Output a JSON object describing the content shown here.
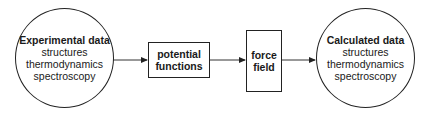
{
  "diagram": {
    "nodes": [
      {
        "id": "experimental",
        "shape": "circle",
        "title": "Experimental data",
        "lines": [
          "structures",
          "thermodynamics",
          "spectroscopy"
        ]
      },
      {
        "id": "potential",
        "shape": "box",
        "lines": [
          "potential",
          "functions"
        ]
      },
      {
        "id": "forcefield",
        "shape": "box",
        "lines": [
          "force",
          "field"
        ]
      },
      {
        "id": "calculated",
        "shape": "circle",
        "title": "Calculated data",
        "lines": [
          "structures",
          "thermodynamics",
          "spectroscopy"
        ]
      }
    ],
    "edges": [
      {
        "from": "experimental",
        "to": "potential"
      },
      {
        "from": "potential",
        "to": "forcefield"
      },
      {
        "from": "forcefield",
        "to": "calculated"
      }
    ],
    "colors": {
      "stroke": "#222222",
      "background": "#ffffff",
      "text": "#1a1a1a"
    }
  }
}
